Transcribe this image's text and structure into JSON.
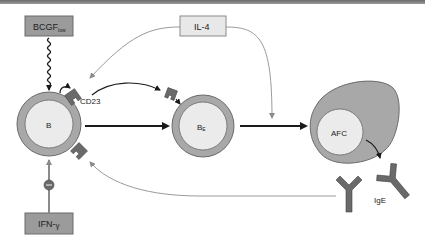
{
  "diagram": {
    "type": "immunology-pathway",
    "nodes": {
      "bcgf": {
        "label": "BCGF",
        "subscript": "low"
      },
      "il4": {
        "label": "IL-4"
      },
      "ifn": {
        "label": "IFN-",
        "greek": "γ"
      },
      "b_cell": {
        "label": "B"
      },
      "be_cell": {
        "label": "B",
        "subscript": "E"
      },
      "afc": {
        "label": "AFC"
      },
      "cd23": {
        "label": "CD23"
      },
      "ige": {
        "label": "IgE"
      }
    },
    "edges": [
      {
        "from": "BCGF_low",
        "to": "B",
        "style": "wavy"
      },
      {
        "from": "IL-4",
        "to": "CD23 receptor on B",
        "style": "grey-curve"
      },
      {
        "from": "IL-4",
        "to": "AFC transition",
        "style": "grey-curve"
      },
      {
        "from": "CD23",
        "to": "B_E receptor",
        "style": "black-curve"
      },
      {
        "from": "B",
        "to": "B_E",
        "style": "black-arrow"
      },
      {
        "from": "B_E",
        "to": "AFC",
        "style": "black-arrow"
      },
      {
        "from": "AFC",
        "to": "IgE",
        "style": "black-curve"
      },
      {
        "from": "IgE",
        "to": "B receptor",
        "style": "grey-feedback"
      },
      {
        "from": "IFN-γ",
        "to": "B",
        "style": "inhibitory"
      }
    ],
    "colors": {
      "box_fill": "#9b9b9b",
      "box_light": "#e8e8e8",
      "cell_outer": "#a8a8a8",
      "cell_inner": "#ebebeb",
      "receptor": "#6a6a6a",
      "grey_line": "#9a9a9a",
      "black_line": "#1a1a1a"
    }
  }
}
